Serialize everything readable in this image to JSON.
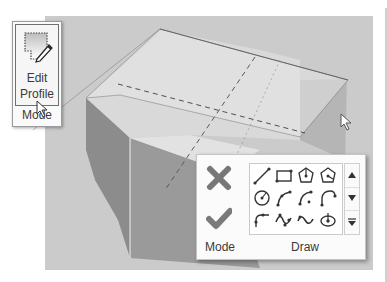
{
  "edit_panel": {
    "button_line1": "Edit",
    "button_line2": "Profile",
    "panel_label": "Mode",
    "icon": "edit-profile-icon"
  },
  "draw_panel": {
    "mode_label": "Mode",
    "draw_label": "Draw",
    "cancel_icon": "cancel-x-icon",
    "finish_icon": "finish-checkmark-icon",
    "tools": [
      {
        "name": "line-tool",
        "row": 0,
        "col": 0
      },
      {
        "name": "rectangle-tool",
        "row": 0,
        "col": 1
      },
      {
        "name": "inscribed-polygon-tool",
        "row": 0,
        "col": 2
      },
      {
        "name": "circumscribed-polygon-tool",
        "row": 0,
        "col": 3
      },
      {
        "name": "circle-tool",
        "row": 1,
        "col": 0
      },
      {
        "name": "start-end-radius-arc-tool",
        "row": 1,
        "col": 1
      },
      {
        "name": "center-ends-arc-tool",
        "row": 1,
        "col": 2
      },
      {
        "name": "tangent-end-arc-tool",
        "row": 1,
        "col": 3
      },
      {
        "name": "fillet-arc-tool",
        "row": 2,
        "col": 0
      },
      {
        "name": "spline-tool",
        "row": 2,
        "col": 1
      },
      {
        "name": "ellipse-tool",
        "row": 2,
        "col": 2
      },
      {
        "name": "partial-ellipse-tool",
        "row": 2,
        "col": 3
      }
    ],
    "scroll": [
      "scroll-up",
      "scroll-down",
      "expand-gallery"
    ]
  },
  "colors": {
    "viewport_bg": "#c9c9c9",
    "icon_gray": "#7a7a7a",
    "panel_bg": "#fbfbfb"
  }
}
